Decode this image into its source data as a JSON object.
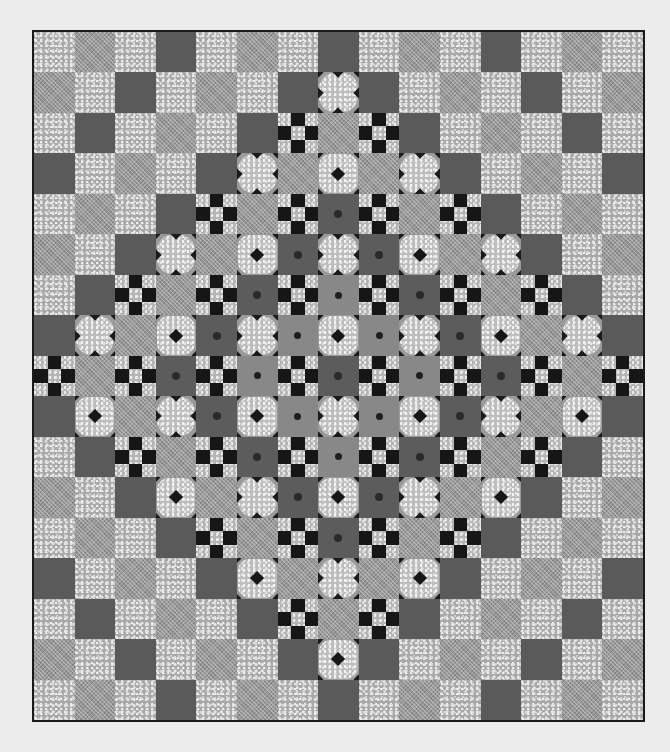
{
  "scene": {
    "subject": "Patchwork quilt (grayscale photo)",
    "background_color": "#ececec",
    "border_color": "#1a1a1a",
    "columns": 15,
    "rows": 17
  },
  "legend": {
    "S": "speckled-light-square",
    "C": "crosshatch-medium-square",
    "D": "dark-solid-square",
    "d": "dark-square-with-center-dot",
    "c": "crosshatch-square-with-center-dot",
    "N": "nine-patch-block",
    "B": "snowball-block-with-diamond",
    "X": "snowball-block-with-notches"
  },
  "colors": {
    "speckled": "#a9a9a9",
    "crosshatch": "#9a9a9a",
    "dark": "#5a5a5a",
    "black_accent": "#161616"
  },
  "grid": [
    "SCSDSCSDSCSDSCS",
    "CSDSCSDXDSCSDSC",
    "SDSCSDNCNDSCSDS",
    "DSCSDXCBCXDSCSD",
    "SCSDNCNdNCNDSCS",
    "CSDXCBdXdBCXDSC",
    "SDNCNdNcNdNCNDS",
    "DXCBdXcBcXdBCXD",
    "NCNdNcNdNcNdNCN",
    "DBCXdBcXcBdXCBD",
    "SDNCNdNcNdNCNDS",
    "CSDBCXdBdXCBDSC",
    "SCSDNCNdNCNDSCS",
    "DSCSDBCXCBDSCSD",
    "SDSCSDNCNDSCSDS",
    "CSDSCSDBDSCSDSC",
    "SCSDSCSDSCSDSCS"
  ]
}
